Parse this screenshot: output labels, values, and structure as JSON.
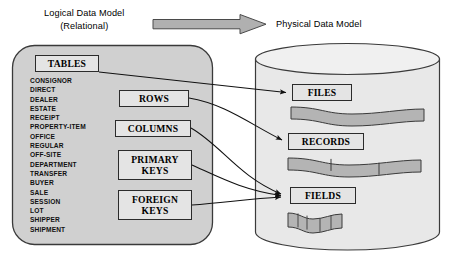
{
  "header": {
    "logical_title_line1": "Logical Data Model",
    "logical_title_line2": "(Relational)",
    "physical_title": "Physical Data Model",
    "arrow_icon": "right-block-arrow"
  },
  "logical_model": {
    "container_label": "logical-data-model-panel",
    "tables_box": "TABLES",
    "table_names": [
      "CONSIGNOR",
      "DIRECT",
      "DEALER",
      "ESTATE",
      "RECEIPT",
      "PROPERTY-ITEM",
      "OFFICE",
      "REGULAR",
      "OFF-SITE",
      "DEPARTMENT",
      "TRANSFER",
      "BUYER",
      "SALE",
      "SESSION",
      "LOT",
      "SHIPPER",
      "SHIPMENT"
    ],
    "concept_boxes": [
      {
        "label": "ROWS"
      },
      {
        "label": "COLUMNS"
      },
      {
        "label": "PRIMARY\nKEYS",
        "line1": "PRIMARY",
        "line2": "KEYS"
      },
      {
        "label": "FOREIGN\nKEYS",
        "line1": "FOREIGN",
        "line2": "KEYS"
      }
    ]
  },
  "physical_model": {
    "container_label": "physical-data-model-cylinder",
    "boxes": [
      {
        "label": "FILES"
      },
      {
        "label": "RECORDS"
      },
      {
        "label": "FIELDS"
      }
    ],
    "tape_bands": [
      {
        "name": "file-band",
        "segments": 1
      },
      {
        "name": "record-band",
        "segments": 3
      },
      {
        "name": "field-band",
        "segments": 5
      }
    ]
  },
  "mappings": [
    {
      "from": "TABLES",
      "to": "FILES"
    },
    {
      "from": "ROWS",
      "to": "RECORDS"
    },
    {
      "from": "COLUMNS",
      "to": "FIELDS"
    },
    {
      "from": "PRIMARY KEYS",
      "to": "FIELDS"
    },
    {
      "from": "FOREIGN KEYS",
      "to": "FIELDS"
    }
  ],
  "colors": {
    "panel_fill": "#d0d0d0",
    "cylinder_fill": "#e8e8e8",
    "box_fill": "#e4e4e4",
    "band_fill": "#b4b4b4",
    "stroke": "#2b2b2b",
    "arrow_fill": "#b0b0b0"
  }
}
